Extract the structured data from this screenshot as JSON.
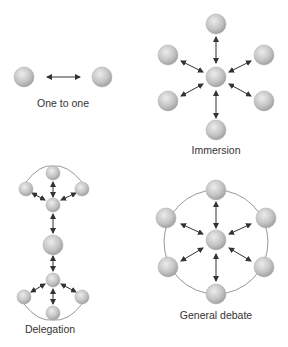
{
  "diagram": {
    "panels": [
      {
        "id": "one-to-one",
        "label": "One to one",
        "nodes": [
          {
            "x": 24,
            "y": 77,
            "r": 10
          },
          {
            "x": 102,
            "y": 77,
            "r": 10
          }
        ],
        "arrows": [
          [
            47,
            77,
            80,
            77
          ]
        ],
        "ring": null
      },
      {
        "id": "immersion",
        "label": "Immersion",
        "nodes": [
          {
            "x": 216,
            "y": 24,
            "r": 10
          },
          {
            "x": 168,
            "y": 55,
            "r": 10
          },
          {
            "x": 264,
            "y": 55,
            "r": 10
          },
          {
            "x": 216,
            "y": 77,
            "r": 10
          },
          {
            "x": 168,
            "y": 101,
            "r": 10
          },
          {
            "x": 264,
            "y": 101,
            "r": 10
          },
          {
            "x": 216,
            "y": 130,
            "r": 10
          }
        ],
        "arrows": [
          [
            216,
            37,
            216,
            63
          ],
          [
            181,
            61,
            203,
            72
          ],
          [
            251,
            61,
            229,
            72
          ],
          [
            181,
            96,
            203,
            84
          ],
          [
            251,
            96,
            229,
            84
          ],
          [
            216,
            91,
            216,
            118
          ]
        ],
        "ring": null
      },
      {
        "id": "delegation",
        "label": "Delegation",
        "nodes": [
          {
            "x": 53,
            "y": 173,
            "r": 7
          },
          {
            "x": 26,
            "y": 189,
            "r": 7
          },
          {
            "x": 82,
            "y": 189,
            "r": 7
          },
          {
            "x": 53,
            "y": 205,
            "r": 7
          },
          {
            "x": 53,
            "y": 245,
            "r": 10
          },
          {
            "x": 53,
            "y": 280,
            "r": 7
          },
          {
            "x": 24,
            "y": 297,
            "r": 7
          },
          {
            "x": 82,
            "y": 297,
            "r": 7
          },
          {
            "x": 53,
            "y": 313,
            "r": 7
          }
        ],
        "arrows": [
          [
            53,
            182,
            53,
            197
          ],
          [
            32,
            193,
            45,
            200
          ],
          [
            76,
            193,
            61,
            200
          ],
          [
            53,
            214,
            53,
            233
          ],
          [
            53,
            256,
            53,
            271
          ],
          [
            45,
            284,
            31,
            292
          ],
          [
            61,
            284,
            76,
            292
          ],
          [
            53,
            289,
            53,
            304
          ]
        ],
        "arcs": [
          "M 26 182 Q 40 164 53 166 Q 67 164 82 182",
          "M 24 304 Q 38 322 53 320 Q 68 322 82 304"
        ]
      },
      {
        "id": "general-debate",
        "label": "General debate",
        "nodes": [
          {
            "x": 216,
            "y": 190,
            "r": 10
          },
          {
            "x": 166,
            "y": 218,
            "r": 10
          },
          {
            "x": 266,
            "y": 218,
            "r": 10
          },
          {
            "x": 216,
            "y": 240,
            "r": 10
          },
          {
            "x": 168,
            "y": 267,
            "r": 10
          },
          {
            "x": 264,
            "y": 267,
            "r": 10
          },
          {
            "x": 216,
            "y": 294,
            "r": 10
          }
        ],
        "arrows": [
          [
            216,
            202,
            216,
            228
          ],
          [
            181,
            224,
            203,
            234
          ],
          [
            251,
            224,
            229,
            234
          ],
          [
            181,
            261,
            203,
            248
          ],
          [
            251,
            261,
            229,
            248
          ],
          [
            216,
            254,
            216,
            281
          ]
        ],
        "ring": {
          "cx": 216,
          "cy": 242,
          "r": 52
        }
      }
    ],
    "labels": [
      {
        "text": "One to one",
        "x": 63,
        "y": 107
      },
      {
        "text": "Immersion",
        "x": 216,
        "y": 154
      },
      {
        "text": "Delegation",
        "x": 50,
        "y": 333
      },
      {
        "text": "General debate",
        "x": 216,
        "y": 319
      }
    ],
    "colors": {
      "node_light": "#e8e8e8",
      "node_dark": "#9a9a9a",
      "arrow": "#333333",
      "ring": "#999999",
      "text": "#333333"
    }
  }
}
